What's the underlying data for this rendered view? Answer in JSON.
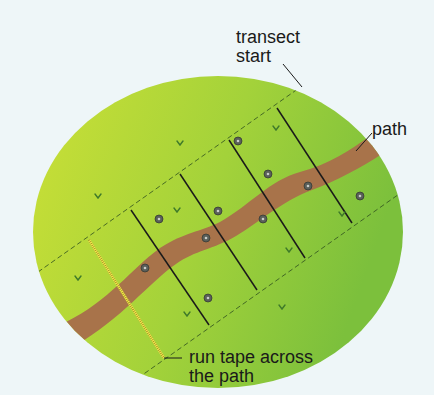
{
  "diagram": {
    "type": "transect sampling field diagram",
    "labels": {
      "transect_start_line1": "transect",
      "transect_start_line2": "start",
      "path": "path",
      "tape_line1": "run tape across",
      "tape_line2": "the path"
    },
    "colors": {
      "background": "#eef6f8",
      "field_left": "#c8df36",
      "field_right": "#7fc23c",
      "path": "#a8734a",
      "tape": "#f2e64a",
      "quadrat_line": "#1a1a1a",
      "dashed_boundary": "#2f4f1f",
      "plant_marker": "#5a5f5a",
      "grass_tuft": "#3f7a2a"
    },
    "elements": {
      "quadrat_dividers": 5,
      "plant_markers": 11,
      "grass_tufts": 11
    }
  }
}
